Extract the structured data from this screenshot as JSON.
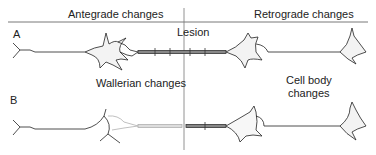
{
  "header": {
    "left_label": "Antegrade changes",
    "right_label": "Retrograde changes"
  },
  "panels": [
    {
      "id": "A",
      "label": "A",
      "annotation": "Lesion"
    },
    {
      "id": "B",
      "label": "B",
      "annotation_left": "Wallerian changes",
      "annotation_right_line1": "Cell body",
      "annotation_right_line2": "changes"
    }
  ],
  "colors": {
    "ink": "#222222",
    "faded": "#b0b0b0",
    "divider": "#888888"
  }
}
